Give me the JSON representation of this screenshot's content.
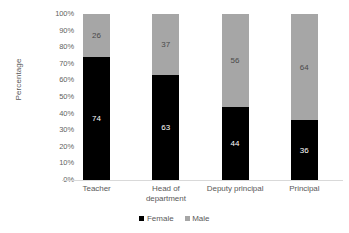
{
  "chart_data": {
    "type": "bar",
    "subtype": "stacked-100-percent",
    "title": "",
    "xlabel": "",
    "ylabel": "Percentage",
    "ylim": [
      0,
      100
    ],
    "grid": false,
    "legend_position": "bottom",
    "categories": [
      "Teacher",
      "Head of department",
      "Deputy principal",
      "Principal"
    ],
    "series": [
      {
        "name": "Female",
        "color": "#000000",
        "values": [
          74,
          63,
          44,
          36
        ]
      },
      {
        "name": "Male",
        "color": "#a6a6a6",
        "values": [
          26,
          37,
          56,
          64
        ]
      }
    ],
    "y_tick_labels": [
      "100%",
      "90%",
      "80%",
      "70%",
      "60%",
      "50%",
      "40%",
      "30%",
      "20%",
      "10%",
      "0%"
    ],
    "y_tick_values": [
      100,
      90,
      80,
      70,
      60,
      50,
      40,
      30,
      20,
      10,
      0
    ],
    "data_labels": {
      "female": [
        "74",
        "63",
        "44",
        "36"
      ],
      "male": [
        "26",
        "37",
        "56",
        "64"
      ]
    }
  },
  "axis": {
    "y_title": "Percentage"
  },
  "legend": {
    "items": [
      {
        "label": "Female",
        "color": "#000000"
      },
      {
        "label": "Male",
        "color": "#a6a6a6"
      }
    ]
  }
}
